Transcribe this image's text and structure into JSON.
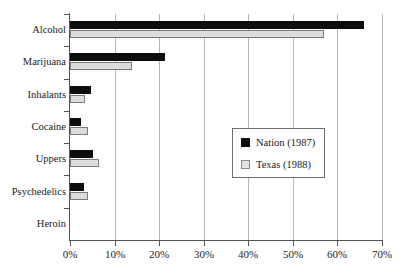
{
  "chart_data": {
    "type": "bar",
    "orientation": "horizontal",
    "title": "",
    "subtitle": "",
    "xlabel": "",
    "ylabel": "",
    "categories": [
      "Alcohol",
      "Marijuana",
      "Inhalants",
      "Cocaine",
      "Uppers",
      "Psychedelics",
      "Heroin"
    ],
    "series": [
      {
        "name": "Nation (1987)",
        "color": "#0d0d0d",
        "values": [
          66.0,
          21.3,
          4.6,
          2.5,
          5.1,
          3.2,
          0.0
        ]
      },
      {
        "name": "Texas (1988)",
        "color": "#dcdcdc",
        "values": [
          57.0,
          14.0,
          3.4,
          4.0,
          6.5,
          4.0,
          0.0
        ]
      }
    ],
    "xlim": [
      0,
      70
    ],
    "xticks": [
      0,
      10,
      20,
      30,
      40,
      50,
      60,
      70
    ],
    "xtick_labels": [
      "0%",
      "10%",
      "20%",
      "30%",
      "40%",
      "50%",
      "60%",
      "70%"
    ],
    "grid": true,
    "grid_axis": "x",
    "legend_position": "center-right",
    "value_suffix": "%"
  },
  "legend": {
    "entries": [
      {
        "label": "Nation (1987)",
        "swatch": "nation-swatch"
      },
      {
        "label": "Texas (1988)",
        "swatch": "texas-swatch"
      }
    ]
  }
}
